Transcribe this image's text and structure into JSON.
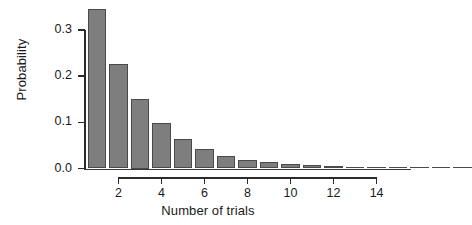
{
  "chart_data": {
    "type": "bar",
    "title": "",
    "subtitle": "",
    "xlabel": "Number of trials",
    "ylabel": "Probability",
    "categories": [
      1,
      2,
      3,
      4,
      5,
      6,
      7,
      8,
      9,
      10,
      11,
      12,
      13,
      14,
      15,
      16,
      17,
      18
    ],
    "values": [
      0.345,
      0.226,
      0.15,
      0.098,
      0.064,
      0.042,
      0.027,
      0.018,
      0.013,
      0.01,
      0.007,
      0.005,
      0.004,
      0.003,
      0.002,
      0.002,
      0.001,
      0.001
    ],
    "series": [
      {
        "name": "Probability",
        "values": [
          0.345,
          0.226,
          0.15,
          0.098,
          0.064,
          0.042,
          0.027,
          0.018,
          0.013,
          0.01,
          0.007,
          0.005,
          0.004,
          0.003,
          0.002,
          0.002,
          0.001,
          0.001
        ]
      }
    ],
    "xlim": [
      0.4,
      15.6
    ],
    "ylim": [
      0.0,
      0.36
    ],
    "xticks": [
      2,
      4,
      6,
      8,
      10,
      12,
      14
    ],
    "xtick_labels": [
      "2",
      "4",
      "6",
      "8",
      "10",
      "12",
      "14"
    ],
    "yticks": [
      0.0,
      0.1,
      0.2,
      0.3
    ],
    "ytick_labels": [
      "0.0",
      "0.1",
      "0.2",
      "0.3"
    ],
    "grid": false,
    "legend": null,
    "bar_color": "#7e7e7e",
    "bar_edge_color": "#4a4a4a",
    "axis_color": "#2b2b2b",
    "background": "#ffffff"
  },
  "axes": {
    "y_label": "Probability",
    "x_label": "Number of trials"
  }
}
